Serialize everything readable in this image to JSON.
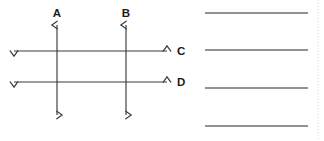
{
  "figure": {
    "type": "geometry-diagram",
    "stroke_color": "#3a3a3a",
    "label_color": "#1b1b1b",
    "background_color": "#ffffff",
    "lines": [
      {
        "label": "A",
        "orientation": "vertical",
        "x": 57,
        "y_start": 25,
        "y_end": 115,
        "arrowheads": "both",
        "label_x": 57,
        "label_y": 17
      },
      {
        "label": "B",
        "orientation": "vertical",
        "x": 126,
        "y_start": 25,
        "y_end": 115,
        "arrowheads": "both",
        "label_x": 126,
        "label_y": 17
      },
      {
        "label": "C",
        "orientation": "horizontal",
        "y": 51,
        "x_start": 14,
        "x_end": 167,
        "arrowheads": "both",
        "label_x": 177,
        "label_y": 55
      },
      {
        "label": "D",
        "orientation": "horizontal",
        "y": 82,
        "x_start": 14,
        "x_end": 167,
        "arrowheads": "both",
        "label_x": 177,
        "label_y": 86
      }
    ]
  },
  "answer_lines": {
    "count": 4,
    "color": "#6e6e6e",
    "x_start": 205,
    "x_end": 308,
    "y_positions": [
      13,
      50,
      88,
      126
    ]
  },
  "page_edge": {
    "x": 318,
    "color": "#d9d9d9"
  }
}
